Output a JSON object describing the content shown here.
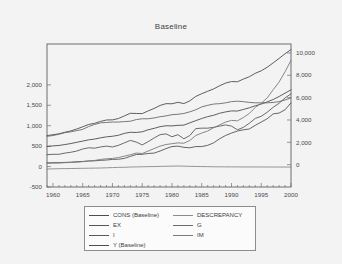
{
  "window": {
    "background_color": "#f1f1f1",
    "card_background_color": "#f3f3f3"
  },
  "chart_data": {
    "type": "line",
    "title": "Baseline",
    "xlabel": "",
    "ylabel": "",
    "grid": false,
    "legend_position": "bottom",
    "x": [
      1959,
      1960,
      1961,
      1962,
      1963,
      1964,
      1965,
      1966,
      1967,
      1968,
      1969,
      1970,
      1971,
      1972,
      1973,
      1974,
      1975,
      1976,
      1977,
      1978,
      1979,
      1980,
      1981,
      1982,
      1983,
      1984,
      1985,
      1986,
      1987,
      1988,
      1989,
      1990,
      1991,
      1992,
      1993,
      1994,
      1995,
      1996,
      1997,
      1998,
      1999,
      2000
    ],
    "x_tick_labels": [
      "1960",
      "1965",
      "1970",
      "1975",
      "1980",
      "1985",
      "1990",
      "1995",
      "2000"
    ],
    "x_ticks": [
      1960,
      1965,
      1970,
      1975,
      1980,
      1985,
      1990,
      1995,
      2000
    ],
    "xlim": [
      1959,
      2000
    ],
    "left_axis": {
      "tick_labels": [
        "2,000",
        "1,500",
        "1,000",
        "500",
        "0",
        "-500"
      ],
      "ticks": [
        2000,
        1500,
        1000,
        500,
        0,
        -500
      ],
      "ylim": [
        -500,
        3000
      ]
    },
    "right_axis": {
      "tick_labels": [
        "10,000",
        "8,000",
        "6,000",
        "4,000",
        "2,000",
        "0"
      ],
      "ticks": [
        10000,
        8000,
        6000,
        4000,
        2000,
        0
      ],
      "ylim": [
        -2000,
        10800
      ]
    },
    "series": [
      {
        "name": "Y (Baseline)",
        "axis": "right",
        "color": "#4d4d4d",
        "values": [
          2600,
          2680,
          2760,
          2900,
          3020,
          3190,
          3390,
          3600,
          3700,
          3870,
          4000,
          4010,
          4130,
          4360,
          4600,
          4580,
          4570,
          4810,
          5030,
          5300,
          5460,
          5450,
          5580,
          5470,
          5710,
          6110,
          6350,
          6570,
          6780,
          7060,
          7300,
          7440,
          7420,
          7660,
          7870,
          8180,
          8400,
          8720,
          9110,
          9510,
          9930,
          10300
        ]
      },
      {
        "name": "CONS (Baseline)",
        "axis": "right",
        "color": "#4d4d4d",
        "values": [
          1620,
          1680,
          1720,
          1800,
          1890,
          2000,
          2110,
          2220,
          2290,
          2400,
          2490,
          2540,
          2630,
          2800,
          2900,
          2880,
          2940,
          3120,
          3250,
          3400,
          3480,
          3470,
          3520,
          3540,
          3740,
          3940,
          4130,
          4300,
          4420,
          4600,
          4720,
          4810,
          4800,
          4940,
          5090,
          5270,
          5420,
          5620,
          5830,
          6100,
          6400,
          6700
        ]
      },
      {
        "name": "I",
        "axis": "left",
        "color": "#5a5a5a",
        "values": [
          290,
          300,
          300,
          330,
          350,
          380,
          430,
          460,
          450,
          480,
          500,
          480,
          520,
          580,
          640,
          600,
          530,
          610,
          700,
          780,
          800,
          730,
          780,
          680,
          760,
          930,
          940,
          940,
          960,
          990,
          1020,
          990,
          900,
          960,
          1060,
          1180,
          1230,
          1330,
          1450,
          1550,
          1680,
          1780
        ]
      },
      {
        "name": "G",
        "axis": "left",
        "color": "#6a6a6a",
        "values": [
          740,
          760,
          790,
          830,
          850,
          880,
          910,
          980,
          1030,
          1070,
          1080,
          1090,
          1090,
          1100,
          1110,
          1150,
          1170,
          1170,
          1190,
          1220,
          1240,
          1270,
          1280,
          1300,
          1340,
          1390,
          1460,
          1500,
          1530,
          1540,
          1560,
          1590,
          1600,
          1590,
          1570,
          1560,
          1560,
          1560,
          1570,
          1590,
          1630,
          1680
        ]
      },
      {
        "name": "EX",
        "axis": "left",
        "color": "#555555",
        "values": [
          90,
          95,
          97,
          102,
          107,
          120,
          125,
          135,
          140,
          152,
          160,
          175,
          180,
          200,
          250,
          295,
          300,
          320,
          330,
          380,
          440,
          490,
          500,
          470,
          460,
          490,
          490,
          520,
          580,
          680,
          760,
          820,
          870,
          900,
          920,
          1010,
          1090,
          1170,
          1290,
          1310,
          1390,
          1560
        ]
      },
      {
        "name": "IM",
        "axis": "left",
        "color": "#7a7a7a",
        "values": [
          80,
          85,
          87,
          95,
          100,
          105,
          120,
          140,
          150,
          175,
          190,
          200,
          220,
          255,
          290,
          330,
          320,
          380,
          440,
          500,
          540,
          560,
          580,
          570,
          640,
          760,
          820,
          870,
          950,
          1020,
          1090,
          1130,
          1120,
          1200,
          1300,
          1450,
          1550,
          1680,
          1880,
          2070,
          2320,
          2600
        ]
      },
      {
        "name": "DESCREPANCY",
        "axis": "left",
        "color": "#8a8a8a",
        "values": [
          -60,
          -55,
          -52,
          -50,
          -48,
          -45,
          -42,
          -40,
          -38,
          -35,
          -30,
          -25,
          -20,
          -18,
          -12,
          -8,
          -5,
          -2,
          0,
          5,
          8,
          10,
          14,
          10,
          6,
          3,
          0,
          -2,
          -5,
          -6,
          -7,
          -8,
          -8,
          -9,
          -9,
          -10,
          -10,
          -10,
          -11,
          -11,
          -12,
          -12
        ]
      }
    ]
  },
  "legend": {
    "items": [
      {
        "label": "CONS (Baseline)",
        "color": "#4d4d4d"
      },
      {
        "label": "DESCREPANCY",
        "color": "#8a8a8a"
      },
      {
        "label": "EX",
        "color": "#555555"
      },
      {
        "label": "G",
        "color": "#6a6a6a"
      },
      {
        "label": "I",
        "color": "#5a5a5a"
      },
      {
        "label": "IM",
        "color": "#7a7a7a"
      },
      {
        "label": "Y (Baseline)",
        "color": "#4d4d4d"
      }
    ]
  }
}
